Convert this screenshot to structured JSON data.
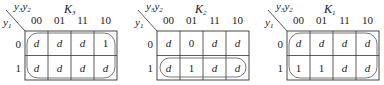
{
  "row_var": "y1",
  "col_vars": "y3y2",
  "col_labels": [
    "00",
    "01",
    "11",
    "10"
  ],
  "row_labels": [
    "0",
    "1"
  ],
  "maps": [
    {
      "title": "K3",
      "title_main": "K",
      "title_sub": "3",
      "cells": [
        [
          "d",
          "d",
          "d",
          "1"
        ],
        [
          "d",
          "d",
          "d",
          "d"
        ]
      ],
      "groups": [
        {
          "rows": [
            0,
            1
          ],
          "cols": [
            0,
            1,
            2,
            3
          ],
          "shape": "all"
        }
      ]
    },
    {
      "title": "K2",
      "title_main": "K",
      "title_sub": "2",
      "cells": [
        [
          "d",
          "0",
          "d",
          "d"
        ],
        [
          "d",
          "1",
          "d",
          "d"
        ]
      ],
      "groups": [
        {
          "rows": [
            1
          ],
          "cols": [
            0,
            1,
            2,
            3
          ],
          "shape": "row"
        }
      ]
    },
    {
      "title": "K1",
      "title_main": "K",
      "title_sub": "1",
      "cells": [
        [
          "d",
          "d",
          "d",
          "d"
        ],
        [
          "1",
          "1",
          "d",
          "d"
        ]
      ],
      "groups": [
        {
          "rows": [
            0,
            1
          ],
          "cols": [
            0,
            1,
            2,
            3
          ],
          "shape": "all"
        }
      ]
    }
  ]
}
